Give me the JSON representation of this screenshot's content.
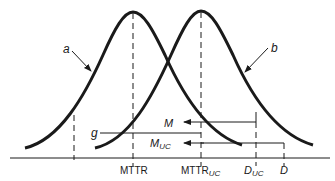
{
  "diagram": {
    "curves": [
      {
        "id": "a",
        "label": "a",
        "peak_x_label": "MTTR"
      },
      {
        "id": "b",
        "label": "b",
        "peak_x_label": "MTTR_UC"
      }
    ],
    "axis_labels": {
      "mttr": "MTTR",
      "mttr_uc_main": "MTTR",
      "mttr_uc_sub": "UC",
      "d_uc_main": "D",
      "d_uc_sub": "UC",
      "d": "D"
    },
    "line_labels": {
      "g": "g",
      "m": "M",
      "m_uc_main": "M",
      "m_uc_sub": "UC"
    },
    "colors": {
      "stroke": "#1a1a1a",
      "background": "#ffffff"
    }
  }
}
